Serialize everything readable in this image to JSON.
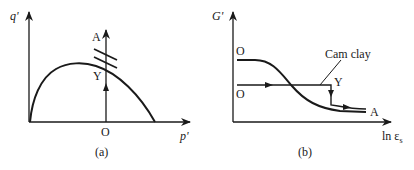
{
  "panels": [
    {
      "id": "a",
      "caption": "(a)",
      "y_axis_label": "q'",
      "x_axis_label": "p'",
      "points": {
        "origin": "O",
        "yield": "Y",
        "end": "A"
      },
      "description": "Yield locus in p'-q' space with vertical stress path O to Y to A"
    },
    {
      "id": "b",
      "caption": "(b)",
      "y_axis_label": "G'",
      "x_axis_label": "ln ε",
      "x_axis_subscript": "s",
      "points": {
        "origin_top": "O",
        "origin_bottom": "O",
        "yield": "Y",
        "end": "A"
      },
      "annotation": "Cam clay",
      "description": "Shear stiffness G' versus ln of shear strain: smooth degradation curve and Cam clay step response"
    }
  ],
  "colors": {
    "stroke": "#1a1a1a",
    "background": "#ffffff"
  }
}
